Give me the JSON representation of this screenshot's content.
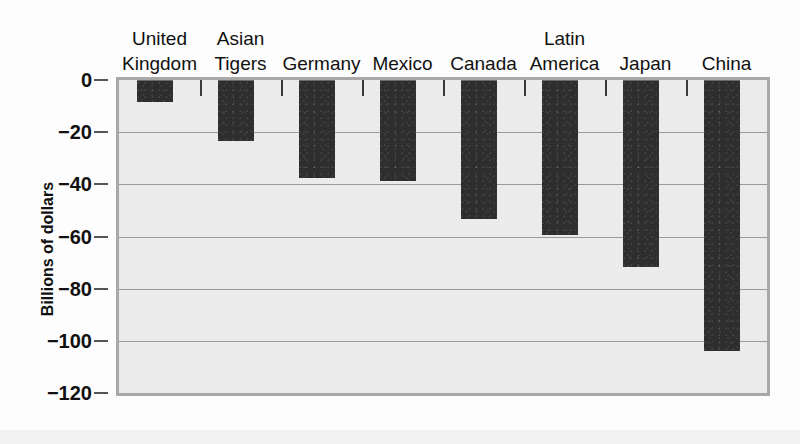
{
  "chart_data": {
    "type": "bar",
    "title": "",
    "xlabel": "",
    "ylabel": "Billions of dollars",
    "categories": [
      "United Kingdom",
      "Asian Tigers",
      "Germany",
      "Mexico",
      "Canada",
      "Latin America",
      "Japan",
      "China"
    ],
    "category_lines": [
      [
        "United",
        "Kingdom"
      ],
      [
        "Asian",
        "Tigers"
      ],
      [
        "Germany",
        ""
      ],
      [
        "Mexico",
        ""
      ],
      [
        "Canada",
        ""
      ],
      [
        "Latin",
        "America"
      ],
      [
        "Japan",
        ""
      ],
      [
        "China",
        ""
      ]
    ],
    "values": [
      -8,
      -23,
      -37,
      -38.5,
      -53,
      -59,
      -71.5,
      -103.5
    ],
    "ylim": [
      -120,
      0
    ],
    "ytick_values": [
      0,
      -20,
      -40,
      -60,
      -80,
      -100,
      -120
    ],
    "ytick_labels": [
      "0",
      "−20",
      "−40",
      "−60",
      "−80",
      "−100",
      "−120"
    ],
    "grid": true,
    "legend": "none",
    "bar_color": "#2e2e2e",
    "plot_background": "#ebebeb",
    "page_background": "#ffffff",
    "gridline_color": "#9a9a9a",
    "axis_frame_color": "#a8a8a8"
  }
}
